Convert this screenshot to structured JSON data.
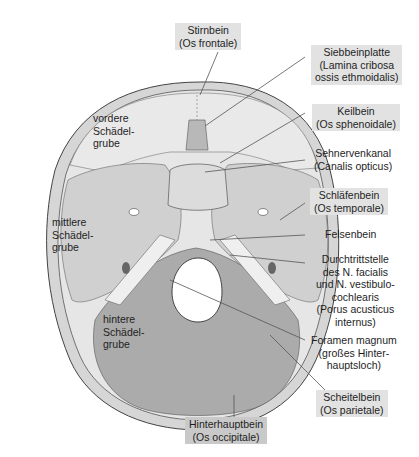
{
  "diagram": {
    "colors": {
      "background": "#ffffff",
      "outer_rim": "#d2d2d2",
      "frontal": "#e4e4e4",
      "middle": "#cfcfcf",
      "posterior": "#a8a8a8",
      "petrous": "#ebebeb",
      "label_box": "#e2e2e2",
      "label_box_dark": "#c9c9c9",
      "leader_line": "#555555"
    },
    "inner_labels": {
      "anterior_fossa": [
        "vordere",
        "Schädel-",
        "grube"
      ],
      "middle_fossa": [
        "mittlere",
        "Schädel-",
        "grube"
      ],
      "posterior_fossa": [
        "hintere",
        "Schädel-",
        "grube"
      ]
    },
    "callouts": {
      "frontal": [
        "Stirnbein",
        "(Os frontale)"
      ],
      "cribriform": [
        "Siebbeinplatte",
        "(Lamina cribosa",
        "ossis ethmoidalis)"
      ],
      "sphenoid": [
        "Keilbein",
        "(Os sphenoidale)"
      ],
      "optic_canal": [
        "Sehnervenkanal",
        "(Canalis opticus)"
      ],
      "temporal": [
        "Schläfenbein",
        "(Os temporale)"
      ],
      "petrous": [
        "Felsenbein"
      ],
      "porus": [
        "Durchtrittstelle",
        "des N. facialis",
        "und N. vestibulo-",
        "cochlearis",
        "(Porus acusticus",
        "internus)"
      ],
      "foramen_magnum": [
        "Foramen magnum",
        "(großes Hinter-",
        "hauptsloch)"
      ],
      "parietal": [
        "Scheitelbein",
        "(Os parietale)"
      ],
      "occipital": [
        "Hinterhauptbein",
        "(Os occipitale)"
      ]
    }
  }
}
